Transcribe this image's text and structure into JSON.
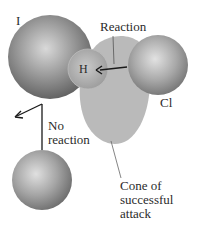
{
  "labels": {
    "iodine": "I",
    "hydrogen": "H",
    "chlorine": "Cl",
    "reaction": "Reaction",
    "no_reaction_line1": "No",
    "no_reaction_line2": "reaction",
    "cone_line1": "Cone of",
    "cone_line2": "successful",
    "cone_line3": "attack"
  },
  "colors": {
    "sphere_dark": "#6e6e6e",
    "sphere_light": "#d8d8d8",
    "cone_fill": "#b4b4b4",
    "text": "#2b2b2b",
    "arrow": "#1a1a1a"
  }
}
